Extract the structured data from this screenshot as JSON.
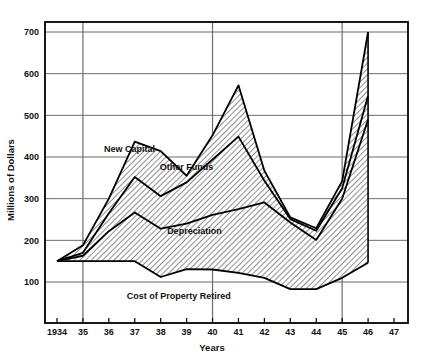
{
  "chart_data": {
    "type": "area",
    "title": "",
    "subtitle": "",
    "xlabel": "Years",
    "ylabel": "Millions of Dollars",
    "xlim": [
      1934,
      1947
    ],
    "ylim": [
      0,
      750
    ],
    "yticks": [
      100,
      200,
      300,
      400,
      500,
      600,
      700
    ],
    "ytick_labels": [
      "100",
      "200",
      "300",
      "400",
      "500",
      "600",
      "700"
    ],
    "xticks": [
      1934,
      1935,
      1936,
      1937,
      1938,
      1939,
      1940,
      1941,
      1942,
      1943,
      1944,
      1945,
      1946,
      1947
    ],
    "xtick_labels": [
      "1934",
      "35",
      "36",
      "37",
      "38",
      "39",
      "40",
      "41",
      "42",
      "43",
      "44",
      "45",
      "46",
      "47"
    ],
    "grid": true,
    "legend_position": "inline-annotations",
    "x": [
      1934,
      1935,
      1936,
      1937,
      1938,
      1939,
      1940,
      1941,
      1942,
      1943,
      1944,
      1945,
      1946
    ],
    "series": [
      {
        "name": "Cost of Property Retired",
        "role": "lower-boundary",
        "values": [
          150,
          150,
          150,
          150,
          112,
          131,
          130,
          122,
          110,
          83,
          83,
          110,
          146
        ]
      },
      {
        "name": "Depreciation",
        "role": "band-upper",
        "values": [
          150,
          163,
          222,
          267,
          228,
          240,
          261,
          275,
          291,
          243,
          201,
          300,
          490
        ]
      },
      {
        "name": "Other Funds",
        "role": "band-upper",
        "values": [
          150,
          170,
          265,
          352,
          306,
          339,
          394,
          449,
          343,
          251,
          223,
          325,
          547
        ]
      },
      {
        "name": "New Capital",
        "role": "band-upper",
        "values": [
          150,
          188,
          300,
          437,
          414,
          355,
          452,
          572,
          367,
          255,
          229,
          342,
          700
        ]
      }
    ],
    "annotations": [
      {
        "text": "New Capital",
        "x": 1936.8,
        "y": 413,
        "name": "new-capital-label"
      },
      {
        "text": "Other Funds",
        "x": 1939.0,
        "y": 368,
        "name": "other-funds-label"
      },
      {
        "text": "Depreciation",
        "x": 1939.3,
        "y": 215,
        "name": "depreciation-label"
      },
      {
        "text": "Cost of Property Retired",
        "x": 1938.7,
        "y": 60,
        "name": "cost-of-property-retired-label"
      }
    ],
    "style": {
      "fill_pattern": "diagonal-hatch",
      "line_color": "#000000",
      "grid_color": "#6b6b6b",
      "axis_color": "#000000",
      "background": "#ffffff",
      "hatch_color": "#3a3a3a"
    }
  }
}
